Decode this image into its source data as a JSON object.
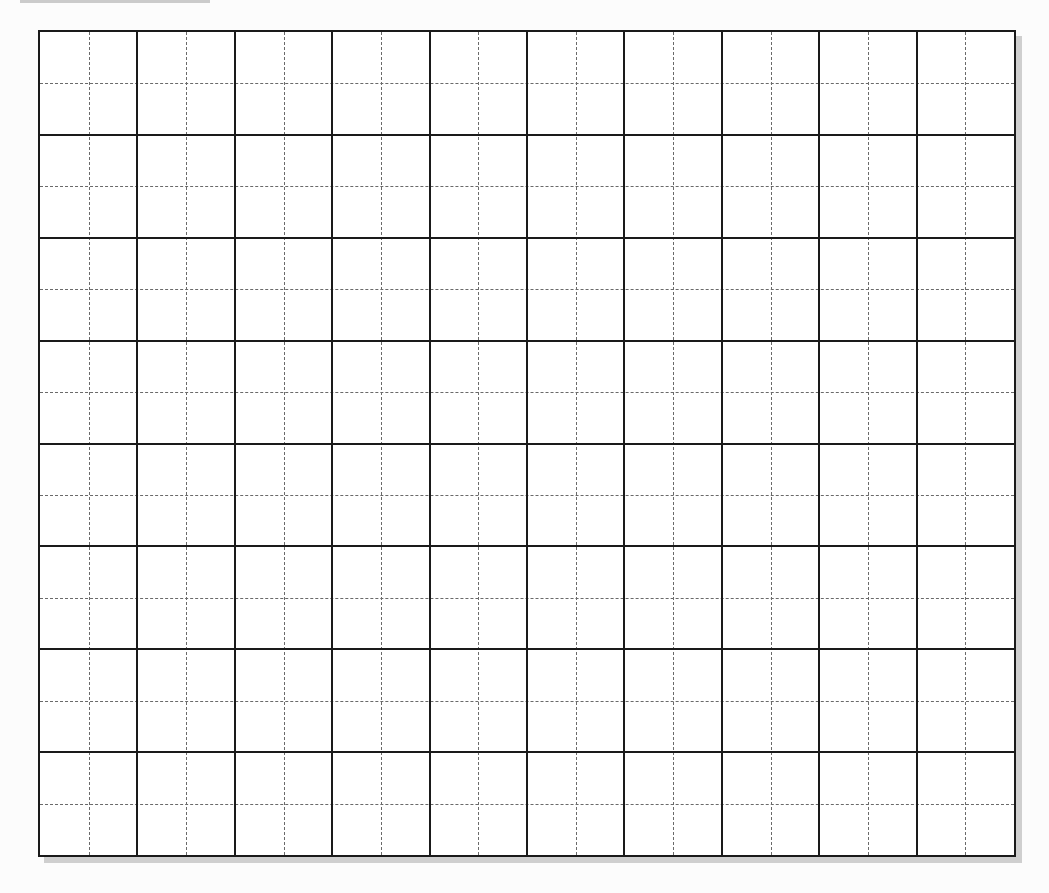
{
  "document": {
    "type": "blank grid worksheet",
    "grid": {
      "columns": 10,
      "rows": 8,
      "subdivisions_per_cell": 2,
      "left": 38,
      "top": 30,
      "width": 978,
      "height": 827,
      "major_line_color": "#1a1a1a",
      "minor_line_color": "#6a6a6a",
      "minor_line_style": "dashed",
      "background_color": "#ffffff",
      "shadow_color": "#cfcfcf"
    },
    "cells": []
  }
}
